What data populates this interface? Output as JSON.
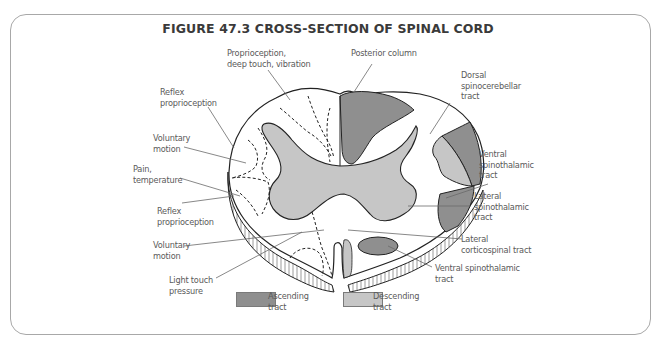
{
  "figure": {
    "title": "FIGURE 47.3 CROSS-SECTION OF SPINAL CORD"
  },
  "colors": {
    "ascending": "#8f8f8f",
    "descending": "#c6c6c6",
    "outline": "#222222",
    "label_text": "#5a5a5a",
    "leader_line": "#6a6a6a",
    "frame": "#a8a8a8"
  },
  "labels": {
    "left": [
      {
        "id": "reflex-proprioception-upper",
        "text": "Reflex\nproprioception"
      },
      {
        "id": "voluntary-motion-upper",
        "text": "Voluntary\nmotion"
      },
      {
        "id": "pain-temperature",
        "text": "Pain,\ntemperature"
      },
      {
        "id": "reflex-proprioception-lower",
        "text": "Reflex\nproprioception"
      },
      {
        "id": "voluntary-motion-lower",
        "text": "Voluntary\nmotion"
      },
      {
        "id": "light-touch-pressure",
        "text": "Light touch\npressure"
      }
    ],
    "top": [
      {
        "id": "proprioception-deep-touch-vibration",
        "text": "Proprioception,\ndeep touch, vibration"
      },
      {
        "id": "posterior-column",
        "text": "Posterior column"
      }
    ],
    "right": [
      {
        "id": "dorsal-spinocerebellar-tract",
        "text": "Dorsal\nspinocerebellar\ntract"
      },
      {
        "id": "ventral-spinothalamic-tract-upper",
        "text": "Ventral\nspinothalamic\ntract"
      },
      {
        "id": "lateral-spinothalamic-tract",
        "text": "Lateral\nspinothalamic\ntract"
      },
      {
        "id": "lateral-corticospinal-tract",
        "text": "Lateral\ncorticospinal tract"
      },
      {
        "id": "ventral-spinothalamic-tract-lower",
        "text": "Ventral spinothalamic\ntract"
      }
    ]
  },
  "legend": [
    {
      "id": "ascending",
      "label": "Ascending\ntract",
      "color": "#8f8f8f"
    },
    {
      "id": "descending",
      "label": "Descending\ntract",
      "color": "#c6c6c6"
    }
  ]
}
